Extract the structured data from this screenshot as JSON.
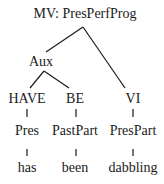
{
  "tree": {
    "root": {
      "label": "MV: PresPerfProg",
      "x": 85,
      "y": 6
    },
    "aux": {
      "label": "Aux",
      "x": 41,
      "y": 54
    },
    "have": {
      "label": "HAVE",
      "x": 27,
      "y": 91
    },
    "be": {
      "label": "BE",
      "x": 75,
      "y": 91
    },
    "vi": {
      "label": "VI",
      "x": 133,
      "y": 91
    },
    "pres": {
      "label": "Pres",
      "x": 27,
      "y": 123
    },
    "pastpart": {
      "label": "PastPart",
      "x": 75,
      "y": 123
    },
    "prespart": {
      "label": "PresPart",
      "x": 133,
      "y": 123
    },
    "has": {
      "label": "has",
      "x": 27,
      "y": 160
    },
    "been": {
      "label": "been",
      "x": 75,
      "y": 160
    },
    "dabbling": {
      "label": "dabbling",
      "x": 133,
      "y": 160
    }
  },
  "edges": [
    {
      "from": "root",
      "to": "aux"
    },
    {
      "from": "root",
      "to": "vi"
    },
    {
      "from": "aux",
      "to": "have"
    },
    {
      "from": "aux",
      "to": "be"
    },
    {
      "from": "have",
      "to": "pres"
    },
    {
      "from": "be",
      "to": "pastpart"
    },
    {
      "from": "vi",
      "to": "prespart"
    },
    {
      "from": "pres",
      "to": "has"
    },
    {
      "from": "pastpart",
      "to": "been"
    },
    {
      "from": "prespart",
      "to": "dabbling"
    }
  ],
  "colors": {
    "line": "#1a1a1a",
    "text": "#1a1a1a",
    "background": "#ffffff"
  }
}
